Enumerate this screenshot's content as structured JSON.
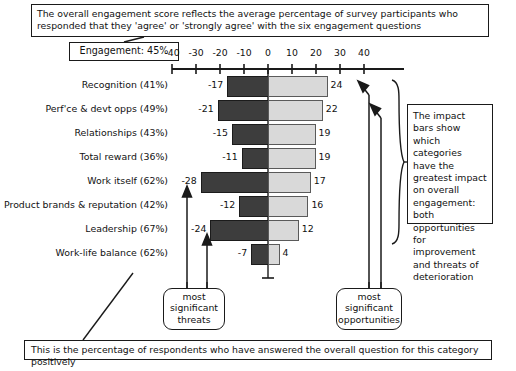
{
  "top_note": "The overall engagement score reflects the average percentage of survey participants who responded that they 'agree' or 'strongly agree' with the six engagement questions",
  "engagement_box": "Engagement: 45%",
  "right_note": "The impact bars show which categories have the greatest impact on overall engagement: both opportunities for improvement and threats of deterioration",
  "bottom_note": "This is the percentage of respondents who have answered the overall question for this category positively",
  "callouts": {
    "threats": "most significant threats",
    "opportunities": "most significant opportunities"
  },
  "chart_data": {
    "type": "bar",
    "orientation": "horizontal-diverging",
    "title": "",
    "xlabel": "",
    "ylabel": "",
    "xlim": [
      -40,
      40
    ],
    "ticks": [
      -40,
      -30,
      -20,
      -10,
      0,
      10,
      20,
      30,
      40
    ],
    "tick_labels": [
      "-40",
      "-30",
      "-20",
      "-10",
      "0",
      "10",
      "20",
      "30",
      "40"
    ],
    "grid": false,
    "legend": "none",
    "categories": [
      "Recognition (41%)",
      "Perf'ce & devt opps (49%)",
      "Relationships (43%)",
      "Total reward (36%)",
      "Work itself (62%)",
      "Product brands & reputation (42%)",
      "Leadership (67%)",
      "Work-life balance (62%)"
    ],
    "series": [
      {
        "name": "threats",
        "color": "#3d3d3d",
        "values": [
          -17,
          -21,
          -15,
          -11,
          -28,
          -12,
          -24,
          -7
        ]
      },
      {
        "name": "opportunities",
        "color": "#d9d9d9",
        "values": [
          24,
          22,
          19,
          19,
          17,
          16,
          12,
          4
        ]
      }
    ],
    "value_labels_negative": [
      "-17",
      "-21",
      "-15",
      "-11",
      "-28",
      "-12",
      "-24",
      "-7"
    ],
    "value_labels_positive": [
      "24",
      "22",
      "19",
      "19",
      "17",
      "16",
      "12",
      "4"
    ]
  }
}
